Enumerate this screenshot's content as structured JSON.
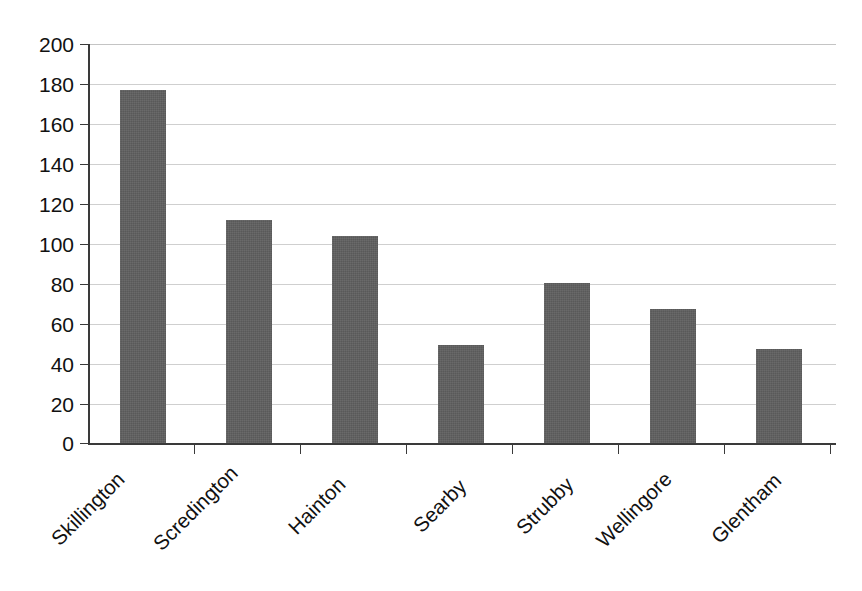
{
  "chart_data": {
    "type": "bar",
    "title": "",
    "subtitle": "",
    "xlabel": "",
    "ylabel": "",
    "categories": [
      "Skillington",
      "Scredington",
      "Hainton",
      "Searby",
      "Strubby",
      "Wellingore",
      "Glentham"
    ],
    "values": [
      177,
      112,
      104,
      49,
      80,
      67,
      47
    ],
    "series": [
      {
        "name": "",
        "values": [
          177,
          112,
          104,
          49,
          80,
          67,
          47
        ]
      }
    ],
    "ylim": [
      0,
      200
    ],
    "ytick_labels": [
      "200",
      "180",
      "160",
      "140",
      "120",
      "100",
      "80",
      "60",
      "40",
      "20",
      "0"
    ],
    "ytick_values": [
      200,
      180,
      160,
      140,
      120,
      100,
      80,
      60,
      40,
      20,
      0
    ],
    "ytick_interval": 20,
    "grid": "horizontal",
    "legend": "none",
    "bar_color": "#595959",
    "gridline_color": "#cfcfcf",
    "axis_color": "#3a3a3a",
    "background_color": "#ffffff",
    "category_label_rotation": "-45"
  }
}
